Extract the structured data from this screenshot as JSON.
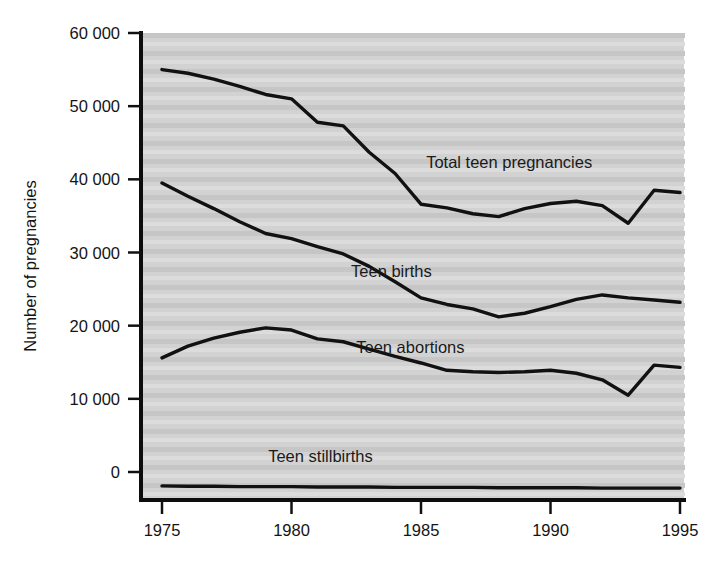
{
  "chart_data": {
    "type": "line",
    "title": "",
    "subtitle": "",
    "xlabel": "",
    "ylabel": "Number of pregnancies",
    "xlim": [
      1975,
      1995
    ],
    "ylim": [
      -3500,
      60000
    ],
    "xticks": [
      1975,
      1980,
      1985,
      1990,
      1995
    ],
    "xtick_labels": [
      "1975",
      "1980",
      "1985",
      "1990",
      "1995"
    ],
    "yticks": [
      0,
      10000,
      20000,
      30000,
      40000,
      50000,
      60000
    ],
    "ytick_labels": [
      "0",
      "10 000",
      "20 000",
      "30 000",
      "40 000",
      "50 000",
      "60 000"
    ],
    "grid": "horizontal-banded-shading",
    "legend_position": "inline-annotations",
    "background": "#d4d4d4",
    "line_color": "#111111",
    "x": [
      1975,
      1976,
      1977,
      1978,
      1979,
      1980,
      1981,
      1982,
      1983,
      1984,
      1985,
      1986,
      1987,
      1988,
      1989,
      1990,
      1991,
      1992,
      1993,
      1994,
      1995
    ],
    "series": [
      {
        "name": "Total teen pregnancies",
        "label": "Total teen pregnancies",
        "label_x": 1985.2,
        "label_y": 41500,
        "values": [
          55000,
          54500,
          53700,
          52700,
          51600,
          51000,
          47800,
          47300,
          43700,
          40800,
          36600,
          36100,
          35300,
          34900,
          36000,
          36700,
          37000,
          36400,
          34000,
          38500,
          38200
        ]
      },
      {
        "name": "Teen births",
        "label": "Teen births",
        "label_x": 1982.3,
        "label_y": 26600,
        "values": [
          39500,
          37700,
          36000,
          34200,
          32600,
          31900,
          30800,
          29800,
          28100,
          26000,
          23800,
          22900,
          22300,
          21200,
          21700,
          22600,
          23600,
          24200,
          23800,
          23500,
          23200
        ]
      },
      {
        "name": "Teen abortions",
        "label": "Teen abortions",
        "label_x": 1982.5,
        "label_y": 16300,
        "values": [
          15600,
          17200,
          18300,
          19100,
          19700,
          19400,
          18200,
          17800,
          16800,
          15800,
          14900,
          13900,
          13700,
          13600,
          13700,
          13900,
          13500,
          12600,
          10500,
          14600,
          14300
        ]
      },
      {
        "name": "Teen stillbirths",
        "label": "Teen stillbirths",
        "label_x": 1979.1,
        "label_y": 1300,
        "values": [
          -1900,
          -1950,
          -1950,
          -2000,
          -2000,
          -2000,
          -2050,
          -2050,
          -2050,
          -2100,
          -2100,
          -2100,
          -2100,
          -2150,
          -2150,
          -2150,
          -2150,
          -2200,
          -2200,
          -2200,
          -2200
        ]
      }
    ]
  },
  "axis": {
    "y_axis_title": "Number of pregnancies"
  }
}
